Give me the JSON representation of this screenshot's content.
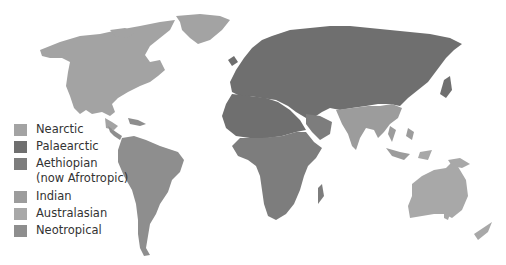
{
  "map": {
    "title": "Zoogeographic regions of the world",
    "background": "#ffffff",
    "border_color": "#b8b8b8",
    "regions": {
      "nearctic": {
        "label": "Nearctic",
        "color": "#a3a3a3"
      },
      "palaearctic": {
        "label": "Palaearctic",
        "color": "#6f6f6f"
      },
      "aethiopian": {
        "label": "Aethiopian (now Afrotropic)",
        "line1": "Aethiopian",
        "line2": "(now Afrotropic)",
        "color": "#7d7d7d"
      },
      "indian": {
        "label": "Indian",
        "color": "#9c9c9c"
      },
      "australasian": {
        "label": "Australasian",
        "color": "#a8a8a8"
      },
      "neotropical": {
        "label": "Neotropical",
        "color": "#8e8e8e"
      }
    }
  },
  "legend": {
    "items": [
      {
        "key": "nearctic",
        "label": "Nearctic",
        "color": "#a3a3a3"
      },
      {
        "key": "palaearctic",
        "label": "Palaearctic",
        "color": "#6f6f6f"
      },
      {
        "key": "aethiopian",
        "label": "Aethiopian",
        "label2": "(now Afrotropic)",
        "color": "#7d7d7d"
      },
      {
        "key": "indian",
        "label": "Indian",
        "color": "#9c9c9c"
      },
      {
        "key": "australasian",
        "label": "Australasian",
        "color": "#a8a8a8"
      },
      {
        "key": "neotropical",
        "label": "Neotropical",
        "color": "#8e8e8e"
      }
    ]
  }
}
